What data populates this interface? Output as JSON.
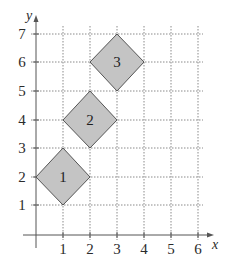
{
  "axes": {
    "x_label": "x",
    "y_label": "y",
    "x_ticks": [
      "1",
      "2",
      "3",
      "4",
      "5",
      "6"
    ],
    "y_ticks": [
      "1",
      "2",
      "3",
      "4",
      "5",
      "6",
      "7"
    ]
  },
  "colors": {
    "grid": "#8a8a8a",
    "axis": "#555555",
    "shape_fill": "#c4c4c4",
    "shape_stroke": "#555555"
  },
  "shapes": [
    {
      "label": "1",
      "center": [
        1,
        2
      ],
      "vertices": [
        [
          0,
          2
        ],
        [
          1,
          3
        ],
        [
          2,
          2
        ],
        [
          1,
          1
        ]
      ]
    },
    {
      "label": "2",
      "center": [
        2,
        4
      ],
      "vertices": [
        [
          1,
          4
        ],
        [
          2,
          5
        ],
        [
          3,
          4
        ],
        [
          2,
          3
        ]
      ]
    },
    {
      "label": "3",
      "center": [
        3,
        6
      ],
      "vertices": [
        [
          2,
          6
        ],
        [
          3,
          7
        ],
        [
          4,
          6
        ],
        [
          3,
          5
        ]
      ]
    }
  ]
}
